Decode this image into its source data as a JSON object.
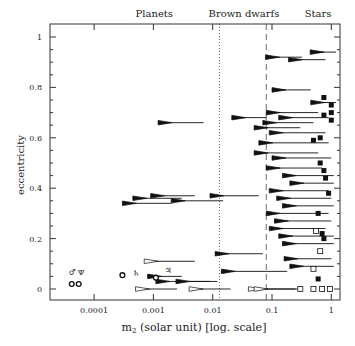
{
  "chart_data": {
    "type": "scatter",
    "title": "",
    "xlabel": "m2 (solar unit) [log. scale]",
    "xlabel_main": "m",
    "xlabel_sub": "2",
    "xlabel_rest": " (solar unit) [log. scale]",
    "ylabel": "eccentricity",
    "xscale": "log",
    "xlim": [
      1.5e-05,
      1.3
    ],
    "ylim": [
      -0.05,
      1.05
    ],
    "xticks": [
      0.0001,
      0.001,
      0.01,
      0.1,
      1
    ],
    "xtick_labels": [
      "0.0001",
      "0.001",
      "0.01",
      "0.1",
      "1"
    ],
    "yticks": [
      0,
      0.2,
      0.4,
      0.6,
      0.8,
      1
    ],
    "ytick_labels": [
      "0",
      "0.2",
      "0.4",
      "0.6",
      "0.8",
      "1"
    ],
    "region_labels": [
      "Planets",
      "Brown dwarfs",
      "Stars"
    ],
    "boundaries": [
      {
        "x": 0.013,
        "style": "dotted"
      },
      {
        "x": 0.08,
        "style": "dashed"
      }
    ],
    "solar_system": [
      {
        "symbol": "♂",
        "name": "Uranus",
        "x": 4.4e-05,
        "e": 0.047
      },
      {
        "symbol": "Ψ",
        "name": "Neptune",
        "x": 5.1e-05,
        "e": 0.009
      },
      {
        "symbol": "♄",
        "name": "Saturn",
        "x": 0.00029,
        "e": 0.056
      },
      {
        "symbol": "♃",
        "name": "Jupiter",
        "x": 0.00095,
        "e": 0.048
      }
    ],
    "series": [
      {
        "name": "filled wedges (m sin i ranges)",
        "points": [
          {
            "x": 0.44,
            "x2": 1.2,
            "e": 0.94
          },
          {
            "x": 0.078,
            "x2": 0.32,
            "e": 0.92
          },
          {
            "x": 0.19,
            "x2": 0.8,
            "e": 0.91
          },
          {
            "x": 0.0012,
            "x2": 0.007,
            "e": 0.66
          },
          {
            "x": 0.021,
            "x2": 0.08,
            "e": 0.68
          },
          {
            "x": 0.1,
            "x2": 0.45,
            "e": 0.79
          },
          {
            "x": 0.45,
            "x2": 1.2,
            "e": 0.74
          },
          {
            "x": 0.08,
            "x2": 0.6,
            "e": 0.7
          },
          {
            "x": 0.13,
            "x2": 0.9,
            "e": 0.68
          },
          {
            "x": 0.07,
            "x2": 0.5,
            "e": 0.66
          },
          {
            "x": 0.05,
            "x2": 0.3,
            "e": 0.64
          },
          {
            "x": 0.09,
            "x2": 0.8,
            "e": 0.62
          },
          {
            "x": 0.06,
            "x2": 0.9,
            "e": 0.58
          },
          {
            "x": 0.05,
            "x2": 0.6,
            "e": 0.54
          },
          {
            "x": 0.1,
            "x2": 1.0,
            "e": 0.52
          },
          {
            "x": 0.08,
            "x2": 0.7,
            "e": 0.48
          },
          {
            "x": 0.15,
            "x2": 1.1,
            "e": 0.45
          },
          {
            "x": 0.2,
            "x2": 1.1,
            "e": 0.42
          },
          {
            "x": 0.09,
            "x2": 0.9,
            "e": 0.39
          },
          {
            "x": 0.12,
            "x2": 1.0,
            "e": 0.36
          },
          {
            "x": 0.00045,
            "x2": 0.003,
            "e": 0.36
          },
          {
            "x": 0.0009,
            "x2": 0.005,
            "e": 0.37
          },
          {
            "x": 0.009,
            "x2": 0.06,
            "e": 0.37
          },
          {
            "x": 0.0003,
            "x2": 0.002,
            "e": 0.34
          },
          {
            "x": 0.002,
            "x2": 0.015,
            "e": 0.35
          },
          {
            "x": 0.15,
            "x2": 1.1,
            "e": 0.33
          },
          {
            "x": 0.08,
            "x2": 0.9,
            "e": 0.3
          },
          {
            "x": 0.11,
            "x2": 1.0,
            "e": 0.27
          },
          {
            "x": 0.09,
            "x2": 0.8,
            "e": 0.24
          },
          {
            "x": 0.13,
            "x2": 1.1,
            "e": 0.21
          },
          {
            "x": 0.15,
            "x2": 1.1,
            "e": 0.18
          },
          {
            "x": 0.011,
            "x2": 0.07,
            "e": 0.14
          },
          {
            "x": 0.16,
            "x2": 1.0,
            "e": 0.12
          },
          {
            "x": 0.2,
            "x2": 1.1,
            "e": 0.09
          },
          {
            "x": 0.014,
            "x2": 0.18,
            "e": 0.07
          },
          {
            "x": 0.0008,
            "x2": 0.003,
            "e": 0.05
          },
          {
            "x": 0.0011,
            "x2": 0.009,
            "e": 0.03
          },
          {
            "x": 0.0024,
            "x2": 0.012,
            "e": 0.03
          }
        ]
      },
      {
        "name": "open wedges",
        "points": [
          {
            "x": 0.0007,
            "x2": 0.005,
            "e": 0.11
          },
          {
            "x": 0.0005,
            "x2": 0.0025,
            "e": 0.0
          },
          {
            "x": 0.004,
            "x2": 0.02,
            "e": 0.0
          },
          {
            "x": 0.04,
            "x2": 0.25,
            "e": 0.0
          },
          {
            "x": 0.05,
            "x2": 0.3,
            "e": 0.0
          }
        ]
      },
      {
        "name": "filled squares",
        "points": [
          {
            "x": 0.75,
            "e": 0.76
          },
          {
            "x": 1.0,
            "e": 0.73
          },
          {
            "x": 1.0,
            "e": 0.7
          },
          {
            "x": 0.75,
            "e": 0.69
          },
          {
            "x": 1.0,
            "e": 0.67
          },
          {
            "x": 0.65,
            "e": 0.6
          },
          {
            "x": 0.5,
            "e": 0.59
          },
          {
            "x": 0.65,
            "e": 0.5
          },
          {
            "x": 0.75,
            "e": 0.47
          },
          {
            "x": 0.8,
            "e": 0.44
          },
          {
            "x": 0.9,
            "e": 0.38
          },
          {
            "x": 0.6,
            "e": 0.3
          },
          {
            "x": 0.7,
            "e": 0.22
          },
          {
            "x": 0.75,
            "e": 0.2
          },
          {
            "x": 0.6,
            "e": 0.04
          }
        ]
      },
      {
        "name": "open squares",
        "points": [
          {
            "x": 0.55,
            "e": 0.23
          },
          {
            "x": 0.65,
            "e": 0.15
          },
          {
            "x": 0.5,
            "e": 0.08
          },
          {
            "x": 0.3,
            "e": 0.0
          },
          {
            "x": 0.5,
            "e": 0.0
          },
          {
            "x": 0.7,
            "e": 0.0
          },
          {
            "x": 0.95,
            "e": 0.0
          }
        ]
      }
    ]
  }
}
